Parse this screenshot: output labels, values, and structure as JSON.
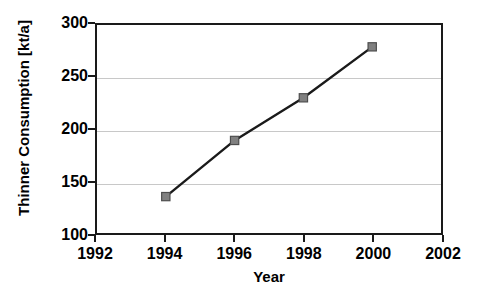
{
  "chart_data": {
    "type": "line",
    "title": "",
    "xlabel": "Year",
    "ylabel": "Thinner Consumption [kt/a]",
    "xlim": [
      1992,
      2002
    ],
    "ylim": [
      100,
      300
    ],
    "xticks": [
      1992,
      1994,
      1996,
      1998,
      2000,
      2002
    ],
    "xtick_labels": [
      "1992",
      "1994",
      "1996",
      "1998",
      "2000",
      "2002"
    ],
    "yticks": [
      100,
      150,
      200,
      250,
      300
    ],
    "ytick_labels": [
      "100",
      "150",
      "200",
      "250",
      "300"
    ],
    "grid": "horizontal",
    "legend": "none",
    "x": [
      1994,
      1996,
      1998,
      2000
    ],
    "values": [
      135,
      189,
      230,
      279
    ],
    "series": [
      {
        "name": "Thinner Consumption",
        "x": [
          1994,
          1996,
          1998,
          2000
        ],
        "values": [
          135,
          189,
          230,
          279
        ],
        "line_color": "#1a1a1a",
        "marker": "square",
        "marker_color": "#808080",
        "marker_edge_color": "#4d4d4d"
      }
    ],
    "colors": {
      "axis": "#1a1a1a",
      "grid": "#c8c8c8",
      "text": "#000000",
      "line": "#1a1a1a",
      "marker_fill": "#808080",
      "marker_edge": "#4d4d4d",
      "background": "#ffffff"
    }
  }
}
